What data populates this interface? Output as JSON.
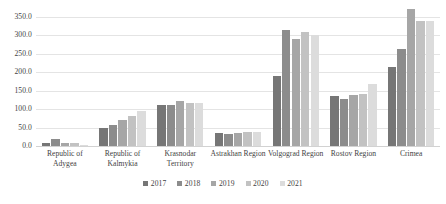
{
  "chart_data": {
    "type": "bar",
    "title": "",
    "subtitle": "",
    "xlabel": "",
    "ylabel": "",
    "ylim": [
      0,
      350
    ],
    "ytick_step": 50,
    "ytick_labels": [
      "0.0",
      "50.0",
      "100.0",
      "150.0",
      "200.0",
      "250.0",
      "300.0",
      "350.0"
    ],
    "ytick_values": [
      0,
      50,
      100,
      150,
      200,
      250,
      300,
      350
    ],
    "grid": true,
    "legend_position": "bottom",
    "categories": [
      "Republic of Adygea",
      "Republic of Kalmykia",
      "Krasnodar Territory",
      "Astrakhan Region",
      "Volgograd Region",
      "Rostov Region",
      "Crimea"
    ],
    "series": [
      {
        "name": "2017",
        "color": "#767676",
        "values": [
          8.0,
          48.0,
          110.0,
          35.0,
          190.0,
          135.0,
          215.0
        ]
      },
      {
        "name": "2018",
        "color": "#8c8c8c",
        "values": [
          18.0,
          58.0,
          112.0,
          32.0,
          315.0,
          128.0,
          262.0
        ]
      },
      {
        "name": "2019",
        "color": "#a6a6a6",
        "values": [
          8.0,
          70.0,
          122.0,
          35.0,
          290.0,
          138.0,
          372.0
        ]
      },
      {
        "name": "2020",
        "color": "#c2c2c2",
        "values": [
          7.0,
          82.0,
          118.0,
          38.0,
          310.0,
          142.0,
          340.0
        ]
      },
      {
        "name": "2021",
        "color": "#dcdcdc",
        "values": [
          4.0,
          95.0,
          118.0,
          38.0,
          300.0,
          168.0,
          338.0
        ]
      }
    ]
  },
  "colors": {
    "gridline": "#e4e4e4",
    "baseline": "#d2d2d2",
    "text": "#3f3f3f",
    "background": "#ffffff"
  }
}
